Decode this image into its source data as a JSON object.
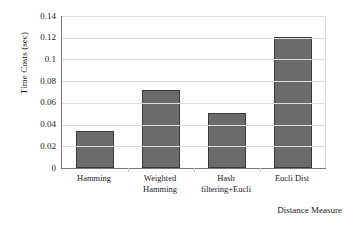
{
  "chart_data": {
    "type": "bar",
    "title": "",
    "xlabel": "Distance Measure",
    "ylabel": "Time Costs (sec)",
    "categories": [
      "Hamming",
      "Weighted Hamming",
      "Hash filtering+Eucli",
      "Eucli Dist"
    ],
    "category_lines": [
      [
        "Hamming",
        ""
      ],
      [
        "Weighted",
        "Hamming"
      ],
      [
        "Hash",
        "filtering+Eucli"
      ],
      [
        "Eucli Dist",
        ""
      ]
    ],
    "values": [
      0.034,
      0.072,
      0.051,
      0.121
    ],
    "ylim": [
      0,
      0.14
    ],
    "ytick_values": [
      0,
      0.02,
      0.04,
      0.06,
      0.08,
      0.1,
      0.12,
      0.14
    ],
    "ytick_labels": [
      "0",
      "0.02",
      "0.04",
      "0.06",
      "0.08",
      "0.1",
      "0.12",
      "0.14"
    ],
    "grid": true,
    "legend": null,
    "bar_color": "#6b6b6b",
    "bar_border_color": "#3a3a3a",
    "gridline_color": "#dcdcdc",
    "axis_color": "#777777"
  }
}
